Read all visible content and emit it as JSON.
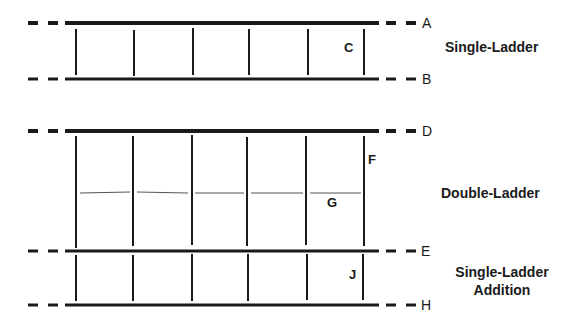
{
  "diagram": {
    "colors": {
      "line": "#1a1a1a",
      "thin_line": "#555555",
      "background": "#ffffff"
    },
    "rails": [
      {
        "id": "A",
        "label": "A",
        "y": 23,
        "thick": 4
      },
      {
        "id": "B",
        "label": "B",
        "y": 79,
        "thick": 3
      },
      {
        "id": "D",
        "label": "D",
        "y": 131,
        "thick": 4
      },
      {
        "id": "E",
        "label": "E",
        "y": 251,
        "thick": 3
      },
      {
        "id": "H",
        "label": "H",
        "y": 305,
        "thick": 3
      }
    ],
    "rung_x": [
      76,
      133,
      192,
      247,
      306,
      364
    ],
    "sections": [
      {
        "id": "single-ladder",
        "title_lines": [
          "Single-Ladder"
        ],
        "top_rail": "A",
        "bottom_rail": "B",
        "member_label": "C"
      },
      {
        "id": "double-ladder",
        "title_lines": [
          "Double-Ladder"
        ],
        "top_rail": "D",
        "bottom_rail": "E",
        "member_label": "F",
        "mid_label": "G"
      },
      {
        "id": "single-ladder-addition",
        "title_lines": [
          "Single-Ladder",
          "Addition"
        ],
        "top_rail": "E",
        "bottom_rail": "H",
        "member_label": "J"
      }
    ],
    "labels": {
      "A": "A",
      "B": "B",
      "C": "C",
      "D": "D",
      "E": "E",
      "F": "F",
      "G": "G",
      "H": "H",
      "J": "J",
      "single_ladder": "Single-Ladder",
      "double_ladder": "Double-Ladder",
      "addition_line1": "Single-Ladder",
      "addition_line2": "Addition"
    }
  }
}
